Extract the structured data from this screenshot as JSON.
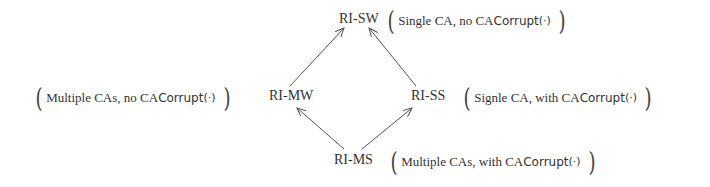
{
  "diagram": {
    "type": "lattice",
    "nodes": [
      {
        "id": "RI-SW",
        "label": "RI-SW",
        "note_text": "Single CA, no CA ",
        "note_func": "Corrupt",
        "note_arg": "(·)"
      },
      {
        "id": "RI-MW",
        "label": "RI-MW",
        "note_text": "Multiple CAs, no CA ",
        "note_func": "Corrupt",
        "note_arg": "(·)"
      },
      {
        "id": "RI-SS",
        "label": "RI-SS",
        "note_text": "Signle CA, with CA ",
        "note_func": "Corrupt",
        "note_arg": "(·)"
      },
      {
        "id": "RI-MS",
        "label": "RI-MS",
        "note_text": "Multiple CAs, with CA ",
        "note_func": "Corrupt",
        "note_arg": "(·)"
      }
    ],
    "edges": [
      {
        "from": "RI-MW",
        "to": "RI-SW"
      },
      {
        "from": "RI-SS",
        "to": "RI-SW"
      },
      {
        "from": "RI-MS",
        "to": "RI-MW"
      },
      {
        "from": "RI-MS",
        "to": "RI-SS"
      }
    ],
    "paren_open": "(",
    "paren_close": ")",
    "colors": {
      "text": "#333333",
      "arrow": "#555555",
      "background": "#ffffff"
    }
  }
}
